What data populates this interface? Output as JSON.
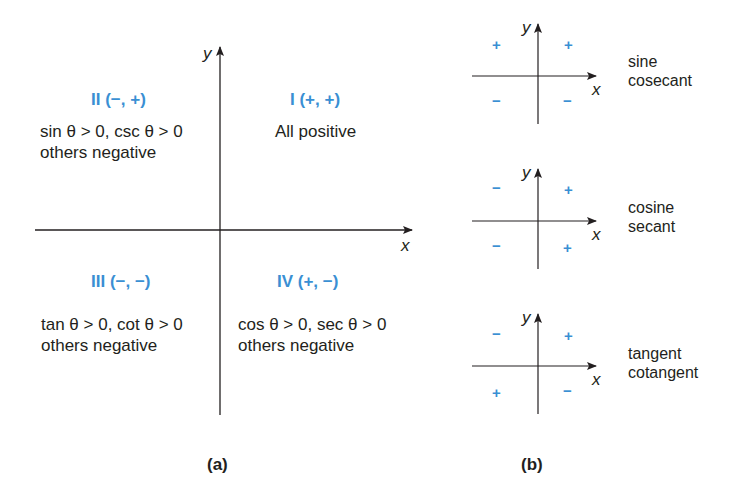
{
  "colors": {
    "accent": "#3a8fd3",
    "ink": "#231f20"
  },
  "panel_a": {
    "caption": "(a)",
    "x_label": "x",
    "y_label": "y",
    "quadrants": [
      {
        "id": "I",
        "heading": "I (+, +)",
        "lines": [
          "All positive"
        ]
      },
      {
        "id": "II",
        "heading": "II (−, +)",
        "lines": [
          "sin θ > 0, csc θ > 0",
          "others negative"
        ]
      },
      {
        "id": "III",
        "heading": "III (−, −)",
        "lines": [
          "tan θ > 0, cot θ > 0",
          "others negative"
        ]
      },
      {
        "id": "IV",
        "heading": "IV (+, −)",
        "lines": [
          "cos θ > 0, sec θ > 0",
          "others negative"
        ]
      }
    ]
  },
  "panel_b": {
    "caption": "(b)",
    "x_label": "x",
    "y_label": "y",
    "diagrams": [
      {
        "functions": [
          "sine",
          "cosecant"
        ],
        "signs": {
          "q1": "+",
          "q2": "+",
          "q3": "−",
          "q4": "−"
        }
      },
      {
        "functions": [
          "cosine",
          "secant"
        ],
        "signs": {
          "q1": "+",
          "q2": "−",
          "q3": "−",
          "q4": "+"
        }
      },
      {
        "functions": [
          "tangent",
          "cotangent"
        ],
        "signs": {
          "q1": "+",
          "q2": "−",
          "q3": "+",
          "q4": "−"
        }
      }
    ]
  }
}
